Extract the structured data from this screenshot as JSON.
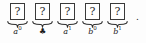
{
  "figure": {
    "kind": "boxed-sequence-with-underbraces",
    "box_glyph": "?",
    "trailing_punctuation": ".",
    "border_color": "#3a3a3a",
    "text_color": "#1c1c1c",
    "background_color": "#fdfdfd",
    "cells": [
      {
        "glyph": "?",
        "label_base": "a",
        "label_sup": "0",
        "label_kind": "variable"
      },
      {
        "glyph": "?",
        "label_base": "♣",
        "label_sup": "",
        "label_kind": "suit"
      },
      {
        "glyph": "?",
        "label_base": "a",
        "label_sup": "1",
        "label_kind": "variable"
      },
      {
        "glyph": "?",
        "label_base": "b",
        "label_sup": "0",
        "label_kind": "variable"
      },
      {
        "glyph": "?",
        "label_base": "b",
        "label_sup": "1",
        "label_kind": "variable"
      }
    ]
  }
}
